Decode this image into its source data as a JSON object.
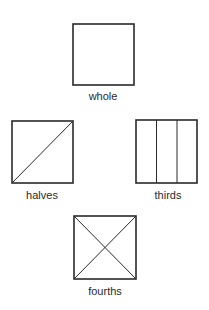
{
  "figures": [
    {
      "id": "whole",
      "label": "whole",
      "divisions": "none"
    },
    {
      "id": "halves",
      "label": "halves",
      "divisions": "one diagonal"
    },
    {
      "id": "thirds",
      "label": "thirds",
      "divisions": "two vertical lines"
    },
    {
      "id": "fourths",
      "label": "fourths",
      "divisions": "two diagonals"
    }
  ],
  "colors": {
    "stroke": "#2a2a2a",
    "background": "#ffffff"
  }
}
